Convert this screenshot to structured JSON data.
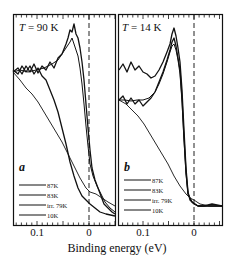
{
  "chart_data": {
    "type": "line",
    "xlabel": "Binding energy  (eV)",
    "ylabel": "",
    "x_reversed": true,
    "xlim": [
      0.13,
      -0.035
    ],
    "grid": false,
    "panels": [
      {
        "id": "a",
        "title": "T = 90 K",
        "panel_letter": "a",
        "x_ticks": [
          "0.1",
          "0"
        ],
        "legend": [
          "87K",
          "83K",
          "irr. 79K",
          "10K"
        ],
        "legend_position": "lower-left",
        "series": [
          {
            "name": "87K",
            "x": [
              0.13,
              0.1,
              0.08,
              0.06,
              0.04,
              0.03,
              0.02,
              0.01,
              0.0,
              -0.01,
              -0.02,
              -0.035
            ],
            "values": [
              0.62,
              0.63,
              0.64,
              0.66,
              0.76,
              0.86,
              0.8,
              0.55,
              0.25,
              0.12,
              0.08,
              0.05
            ]
          },
          {
            "name": "83K",
            "x": [
              0.13,
              0.1,
              0.08,
              0.06,
              0.04,
              0.03,
              0.02,
              0.01,
              0.0,
              -0.01,
              -0.02,
              -0.035
            ],
            "values": [
              0.62,
              0.62,
              0.63,
              0.66,
              0.74,
              0.8,
              0.74,
              0.52,
              0.26,
              0.12,
              0.08,
              0.05
            ]
          },
          {
            "name": "irr. 79K",
            "x": [
              0.13,
              0.1,
              0.08,
              0.06,
              0.04,
              0.02,
              0.01,
              0.0,
              -0.01,
              -0.02,
              -0.035
            ],
            "values": [
              0.62,
              0.63,
              0.62,
              0.6,
              0.5,
              0.3,
              0.2,
              0.14,
              0.1,
              0.08,
              0.05
            ]
          },
          {
            "name": "10K",
            "x": [
              0.13,
              0.11,
              0.09,
              0.07,
              0.05,
              0.03,
              0.01,
              0.0,
              -0.01,
              -0.02,
              -0.035
            ],
            "values": [
              0.62,
              0.58,
              0.5,
              0.42,
              0.34,
              0.25,
              0.16,
              0.12,
              0.1,
              0.08,
              0.06
            ]
          }
        ]
      },
      {
        "id": "b",
        "title": "T = 14 K",
        "panel_letter": "b",
        "x_ticks": [
          "0.1",
          "0"
        ],
        "legend": [
          "87K",
          "83K",
          "irr. 79K",
          "10K"
        ],
        "legend_position": "lower-left",
        "series": [
          {
            "name": "87K",
            "x": [
              0.13,
              0.1,
              0.08,
              0.06,
              0.04,
              0.03,
              0.02,
              0.01,
              0.0,
              -0.01,
              -0.02,
              -0.035
            ],
            "values": [
              0.7,
              0.66,
              0.64,
              0.68,
              0.8,
              0.86,
              0.7,
              0.35,
              0.14,
              0.1,
              0.1,
              0.1
            ]
          },
          {
            "name": "83K",
            "x": [
              0.13,
              0.1,
              0.08,
              0.06,
              0.04,
              0.03,
              0.02,
              0.01,
              0.0,
              -0.01,
              -0.02,
              -0.035
            ],
            "values": [
              0.56,
              0.56,
              0.56,
              0.6,
              0.76,
              0.82,
              0.68,
              0.34,
              0.14,
              0.1,
              0.1,
              0.1
            ]
          },
          {
            "name": "irr. 79K",
            "x": [
              0.13,
              0.1,
              0.08,
              0.06,
              0.04,
              0.03,
              0.02,
              0.01,
              0.0,
              -0.01,
              -0.02,
              -0.035
            ],
            "values": [
              0.56,
              0.57,
              0.58,
              0.62,
              0.74,
              0.8,
              0.66,
              0.33,
              0.14,
              0.1,
              0.1,
              0.1
            ]
          },
          {
            "name": "10K",
            "x": [
              0.13,
              0.11,
              0.09,
              0.07,
              0.05,
              0.03,
              0.01,
              0.0,
              -0.01,
              -0.02,
              -0.035
            ],
            "values": [
              0.56,
              0.52,
              0.46,
              0.4,
              0.33,
              0.24,
              0.16,
              0.13,
              0.11,
              0.1,
              0.1
            ]
          }
        ]
      }
    ]
  },
  "labels": {
    "panel_a_title": "T = 90 K",
    "panel_b_title": "T = 14 K",
    "panel_a_letter": "a",
    "panel_b_letter": "b",
    "xaxis_label": "Binding energy  (eV)",
    "tick_01": "0.1",
    "tick_0": "0",
    "legend": [
      "87K",
      "83K",
      "irr. 79K",
      "10K"
    ]
  }
}
